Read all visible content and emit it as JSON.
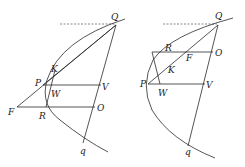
{
  "figure": {
    "colors": {
      "line": "#2a2a2a",
      "background": "#ffffff"
    }
  },
  "left_diagram": {
    "labels": {
      "Q": "Q",
      "K": "K",
      "P": "P",
      "W": "W",
      "V": "V",
      "F": "F",
      "R": "R",
      "O": "O",
      "q": "q"
    }
  },
  "right_diagram": {
    "labels": {
      "Q": "Q",
      "R": "R",
      "F": "F",
      "O": "O",
      "K": "K",
      "P": "P",
      "W": "W",
      "V": "V",
      "q": "q"
    }
  }
}
